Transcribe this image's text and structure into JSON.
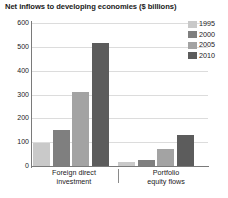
{
  "chart_data": {
    "type": "bar",
    "title": "Net inflows to developing economies ($ billions)",
    "xlabel": "",
    "ylabel": "",
    "ylim": [
      0,
      600
    ],
    "yticks": [
      0,
      100,
      200,
      300,
      400,
      500,
      600
    ],
    "ytick_labels": [
      "0",
      "100",
      "200",
      "300",
      "400",
      "500",
      "600"
    ],
    "grid": true,
    "legend_position": "top-right",
    "categories": [
      "Foreign direct investment",
      "Portfolio equity flows"
    ],
    "category_lines": [
      [
        "Foreign direct",
        "investment"
      ],
      [
        "Portfolio",
        "equity flows"
      ]
    ],
    "series": [
      {
        "name": "1995",
        "color": "#c9c9c9",
        "values": [
          95,
          15
        ]
      },
      {
        "name": "2000",
        "color": "#7f7f7f",
        "values": [
          150,
          25
        ]
      },
      {
        "name": "2005",
        "color": "#a3a3a3",
        "values": [
          310,
          70
        ]
      },
      {
        "name": "2010",
        "color": "#5c5c5c",
        "values": [
          515,
          130
        ]
      }
    ]
  },
  "legend": {
    "items": [
      {
        "label": "1995",
        "color": "#c9c9c9"
      },
      {
        "label": "2000",
        "color": "#7f7f7f"
      },
      {
        "label": "2005",
        "color": "#a3a3a3"
      },
      {
        "label": "2010",
        "color": "#5c5c5c"
      }
    ]
  }
}
